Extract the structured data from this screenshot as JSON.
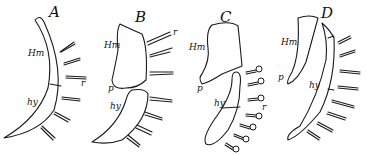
{
  "figure": {
    "panels": [
      {
        "id": "A",
        "labels": {
          "hyomandibular": "Hm",
          "hyoid": "hy",
          "ray": "r"
        }
      },
      {
        "id": "B",
        "labels": {
          "hyomandibular": "Hm",
          "hyoid": "hy",
          "ray": "r",
          "process": "p"
        }
      },
      {
        "id": "C",
        "labels": {
          "hyomandibular": "Hm",
          "hyoid": "hy",
          "ray": "r",
          "process": "p"
        }
      },
      {
        "id": "D",
        "labels": {
          "hyomandibular": "Hm",
          "hyoid": "hy",
          "process": "p"
        }
      }
    ]
  }
}
